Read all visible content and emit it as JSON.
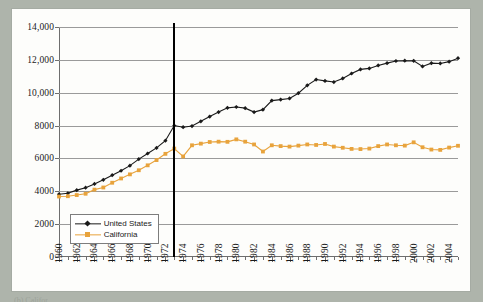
{
  "page": {
    "background_color": "#aeb4ab",
    "panel_color": "#fdfdfb"
  },
  "chart_data": {
    "type": "line",
    "title": "",
    "subtitle": "",
    "xlabel": "",
    "ylabel": "",
    "xlim": [
      1960,
      2005
    ],
    "ylim": [
      0,
      14000
    ],
    "ytick_values": [
      0,
      2000,
      4000,
      6000,
      8000,
      10000,
      12000,
      14000
    ],
    "ytick_labels": [
      "0",
      "2000",
      "4000",
      "6000",
      "8000",
      "10,000",
      "12,000",
      "14,000"
    ],
    "xtick_labels": [
      "1960",
      "1962",
      "1964",
      "1966",
      "1968",
      "1970",
      "1972",
      "1974",
      "1976",
      "1978",
      "1980",
      "1982",
      "1984",
      "1986",
      "1988",
      "1990",
      "1992",
      "1994",
      "1996",
      "1998",
      "2000",
      "2002",
      "2004"
    ],
    "xtick_step_years": 2,
    "minor_tick_step_years": 1,
    "grid": "horizontal",
    "legend_position": "lower-left-inside",
    "annotations": [
      {
        "name": "vertical-reference-line",
        "type": "vline",
        "x": 1973,
        "color": "#000000",
        "width_px": 2.4,
        "label": ""
      }
    ],
    "x": [
      1960,
      1961,
      1962,
      1963,
      1964,
      1965,
      1966,
      1967,
      1968,
      1969,
      1970,
      1971,
      1972,
      1973,
      1974,
      1975,
      1976,
      1977,
      1978,
      1979,
      1980,
      1981,
      1982,
      1983,
      1984,
      1985,
      1986,
      1987,
      1988,
      1989,
      1990,
      1991,
      1992,
      1993,
      1994,
      1995,
      1996,
      1997,
      1998,
      1999,
      2000,
      2001,
      2002,
      2003,
      2004,
      2005
    ],
    "series": [
      {
        "name": "United States",
        "color": "#1a1a1a",
        "marker": "diamond",
        "values": [
          3820,
          3880,
          4070,
          4220,
          4450,
          4700,
          4980,
          5250,
          5560,
          5960,
          6300,
          6640,
          7080,
          8000,
          7900,
          7970,
          8260,
          8550,
          8820,
          9080,
          9130,
          9060,
          8820,
          8970,
          9520,
          9580,
          9650,
          9970,
          10450,
          10800,
          10720,
          10650,
          10870,
          11170,
          11420,
          11480,
          11660,
          11800,
          11930,
          11950,
          11940,
          11600,
          11800,
          11780,
          11890,
          12100
        ]
      },
      {
        "name": "California",
        "color": "#e8a33c",
        "marker": "square",
        "values": [
          3680,
          3700,
          3770,
          3850,
          4100,
          4230,
          4520,
          4780,
          5030,
          5280,
          5580,
          5900,
          6280,
          6600,
          6120,
          6800,
          6900,
          7000,
          7020,
          7010,
          7160,
          7020,
          6850,
          6420,
          6800,
          6750,
          6720,
          6780,
          6850,
          6820,
          6880,
          6720,
          6650,
          6580,
          6570,
          6600,
          6750,
          6850,
          6800,
          6780,
          6980,
          6680,
          6540,
          6520,
          6660,
          6770
        ]
      }
    ]
  },
  "legend": {
    "items": [
      {
        "label": "United States",
        "color": "#1a1a1a",
        "marker": "diamond"
      },
      {
        "label": "California",
        "color": "#e8a33c",
        "marker": "square"
      }
    ]
  },
  "caption": {
    "sliver_text": "(b) Califor"
  }
}
